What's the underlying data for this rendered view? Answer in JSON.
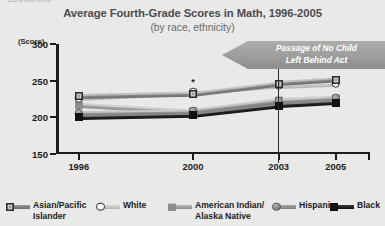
{
  "top_cutoff_text": "EDUCATION",
  "header": {
    "title": "Average Fourth-Grade Scores in Math, 1996-2005",
    "subtitle": "(by race, ethnicity)"
  },
  "axes": {
    "ylabel": "(Score)",
    "yticks": [
      300,
      250,
      200,
      150
    ],
    "xticks": [
      1996,
      2000,
      2003,
      2005
    ]
  },
  "annotation": {
    "line1": "Passage of No Child",
    "line2": "Left Behind Act",
    "at_year": 2003,
    "asterisk": "*"
  },
  "legend": [
    {
      "label": "Asian/Pacific\nIslander",
      "marker": "square-dark-ring",
      "color": "#2b2b2b"
    },
    {
      "label": "White",
      "marker": "circle-open",
      "color": "#fbfbfa"
    },
    {
      "label": "American Indian/\nAlaska Native",
      "marker": "square-gray",
      "color": "#8e8e8c"
    },
    {
      "label": "Hispanic",
      "marker": "circle-shaded",
      "color": "#9b9b99"
    },
    {
      "label": "Black",
      "marker": "square-black",
      "color": "#121212"
    }
  ],
  "chart_data": {
    "type": "line",
    "title": "Average Fourth-Grade Scores in Math, 1996-2005",
    "subtitle": "(by race, ethnicity)",
    "xlabel": "",
    "ylabel": "(Score)",
    "x": [
      1996,
      2000,
      2003,
      2005
    ],
    "ylim": [
      150,
      300
    ],
    "yticks": [
      150,
      200,
      250,
      300
    ],
    "grid": false,
    "legend_position": "bottom",
    "series": [
      {
        "name": "Asian/Pacific Islander",
        "values": [
          229,
          232,
          246,
          251
        ],
        "color": "#2b2b2b",
        "marker": "square-dark-ring"
      },
      {
        "name": "White",
        "values": [
          226,
          234,
          243,
          246
        ],
        "color": "#fbfbfa",
        "marker": "circle-open"
      },
      {
        "name": "American Indian/Alaska Native",
        "values": [
          217,
          208,
          223,
          226
        ],
        "color": "#8e8e8c",
        "marker": "square-gray"
      },
      {
        "name": "Hispanic",
        "values": [
          206,
          208,
          222,
          226
        ],
        "color": "#9b9b99",
        "marker": "circle-shaded"
      },
      {
        "name": "Black",
        "values": [
          200,
          203,
          216,
          220
        ],
        "color": "#121212",
        "marker": "square-black"
      }
    ],
    "annotations": [
      {
        "text": "Passage of No Child Left Behind Act",
        "at_x": 2003,
        "type": "vertical-line-with-arrow-banner"
      },
      {
        "text": "*",
        "at_x": 2000,
        "at_y": 234,
        "type": "point-asterisk"
      }
    ]
  }
}
